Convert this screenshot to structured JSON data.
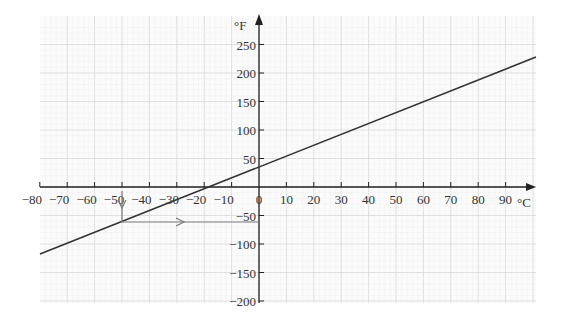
{
  "chart_data": {
    "type": "line",
    "title": "",
    "xlabel": "°C",
    "ylabel": "°F",
    "xlim": [
      -80,
      100
    ],
    "ylim": [
      -200,
      280
    ],
    "x_ticks": [
      -80,
      -70,
      -60,
      -50,
      -40,
      -30,
      -20,
      -10,
      0,
      10,
      20,
      30,
      40,
      50,
      60,
      70,
      80,
      90
    ],
    "x_tick_labels": [
      "−80",
      "−70",
      "−60",
      "−50",
      "−40",
      "−30",
      "−20",
      "−10",
      "0",
      "10",
      "20",
      "30",
      "40",
      "50",
      "60",
      "70",
      "80",
      "90"
    ],
    "y_ticks": [
      250,
      200,
      150,
      100,
      50,
      -50,
      -100,
      -150,
      -200
    ],
    "y_tick_labels": [
      "250",
      "200",
      "150",
      "100",
      "50",
      "−50",
      "−100",
      "−150",
      "−200"
    ],
    "grid": true,
    "series": [
      {
        "name": "F = 1.8C + 32",
        "x": [
          -80,
          100
        ],
        "y": [
          -112,
          212
        ]
      }
    ],
    "annotations": [
      {
        "type": "arrow-down",
        "at_x": -50,
        "description": "from x-axis at −50°C down to line"
      },
      {
        "type": "arrow-right",
        "at_y": -58,
        "description": "from line horizontally to y-axis at −58°F"
      }
    ]
  },
  "colors": {
    "line": "#333333",
    "annotation": "#777777",
    "grid_minor": "#eeeeee",
    "grid_major": "#d8d8d8",
    "axis": "#222222"
  }
}
